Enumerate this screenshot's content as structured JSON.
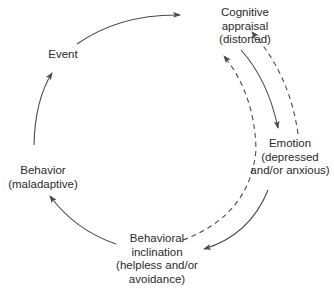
{
  "diagram": {
    "type": "cycle",
    "nodes": {
      "event": {
        "lines": [
          "Event"
        ]
      },
      "cognitive": {
        "lines": [
          "Cognitive",
          "appraisal",
          "(distorted)"
        ]
      },
      "emotion": {
        "lines": [
          "Emotion",
          "(depressed",
          "and/or anxious)"
        ]
      },
      "inclination": {
        "lines": [
          "Behavioral",
          "inclination",
          "(helpless and/or",
          "avoidance)"
        ]
      },
      "behavior": {
        "lines": [
          "Behavior",
          "(maladaptive)"
        ]
      }
    },
    "edges": [
      {
        "from": "Event",
        "to": "Cognitive appraisal (distorted)",
        "style": "solid"
      },
      {
        "from": "Cognitive appraisal (distorted)",
        "to": "Emotion (depressed and/or anxious)",
        "style": "solid"
      },
      {
        "from": "Emotion (depressed and/or anxious)",
        "to": "Cognitive appraisal (distorted)",
        "style": "dashed"
      },
      {
        "from": "Emotion (depressed and/or anxious)",
        "to": "Behavioral inclination (helpless and/or avoidance)",
        "style": "solid"
      },
      {
        "from": "Behavioral inclination (helpless and/or avoidance)",
        "to": "Cognitive appraisal (distorted)",
        "style": "dashed"
      },
      {
        "from": "Behavioral inclination (helpless and/or avoidance)",
        "to": "Behavior (maladaptive)",
        "style": "solid"
      },
      {
        "from": "Behavior (maladaptive)",
        "to": "Event",
        "style": "solid"
      }
    ],
    "colors": {
      "line": "#4a4a4a",
      "text": "#2a2a2a",
      "background": "#ffffff"
    }
  }
}
